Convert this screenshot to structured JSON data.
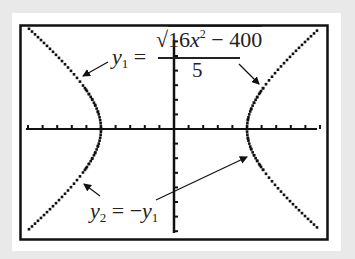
{
  "chart_data": {
    "type": "line",
    "title": "",
    "xlabel": "",
    "ylabel": "",
    "xlim": [
      -10,
      10
    ],
    "ylim": [
      -7,
      7
    ],
    "xscl": 1,
    "yscl": 1,
    "grid": false,
    "series": [
      {
        "name": "y1",
        "label": "y1 = sqrt(16x^2 - 400)/5",
        "style": "dotted",
        "x": [
          -10,
          -9,
          -8,
          -7,
          -6,
          -5.5,
          -5,
          5,
          5.5,
          6,
          7,
          8,
          9,
          10
        ],
        "values": [
          6.93,
          6.13,
          5.33,
          4.51,
          3.66,
          2.54,
          0,
          0,
          2.54,
          3.66,
          4.51,
          5.33,
          6.13,
          6.93
        ]
      },
      {
        "name": "y2",
        "label": "y2 = -y1",
        "style": "dotted",
        "x": [
          -10,
          -9,
          -8,
          -7,
          -6,
          -5.5,
          -5,
          5,
          5.5,
          6,
          7,
          8,
          9,
          10
        ],
        "values": [
          -6.93,
          -6.13,
          -5.33,
          -4.51,
          -3.66,
          -2.54,
          0,
          0,
          -2.54,
          -3.66,
          -4.51,
          -5.33,
          -6.13,
          -6.93
        ]
      }
    ],
    "annotations": [
      {
        "text_var": "y",
        "text_sub": "1",
        "eq": "=",
        "numerator_root": "16x",
        "numerator_sup": "2",
        "numerator_rest": " − 400",
        "denominator": "5"
      },
      {
        "text": "y2 = −y1"
      }
    ]
  },
  "labels": {
    "y1_var": "y",
    "y1_sub": "1",
    "eq": "=",
    "root_sign": "√",
    "num_a": "16",
    "num_x": "x",
    "num_sup": "2",
    "num_rest": " − 400",
    "den": "5",
    "y2_var": "y",
    "y2_sub": "2",
    "y2_eq": " = −",
    "y2_rhs_var": "y",
    "y2_rhs_sub": "1"
  }
}
